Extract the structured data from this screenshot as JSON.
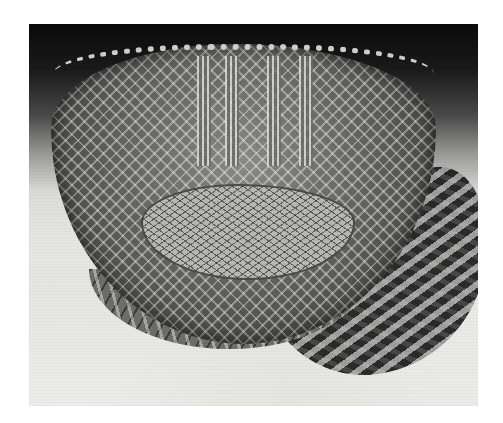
{
  "image": {
    "description": "Black-and-white photograph of a heart-shaped cut-glass bowl with diamond/strawberry-diamond cutting, vertical fluted panels, scalloped rim, and a cross-hatched base, casting a patterned shadow",
    "subject": "Heart-shaped cut-glass dish",
    "palette": {
      "background_top": "#0a0a0a",
      "background_bottom": "#ececea",
      "page": "#ffffff"
    }
  }
}
